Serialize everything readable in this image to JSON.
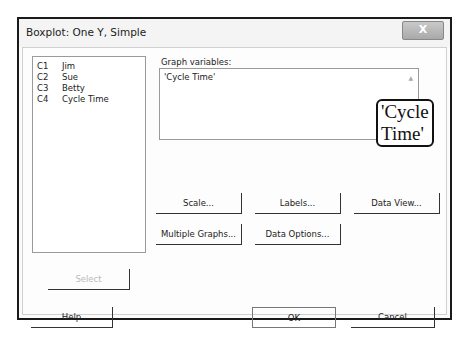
{
  "dialog": {
    "title": "Boxplot: One Y, Simple",
    "close_label": "X"
  },
  "variable_list": [
    {
      "column": "C1",
      "name": "Jim"
    },
    {
      "column": "C2",
      "name": "Sue"
    },
    {
      "column": "C3",
      "name": "Betty"
    },
    {
      "column": "C4",
      "name": "Cycle Time"
    }
  ],
  "graph_variables": {
    "label": "Graph variables:",
    "value": "'Cycle Time'",
    "callout": "'Cycle Time'"
  },
  "buttons": {
    "scale": "Scale...",
    "labels": "Labels...",
    "data_view": "Data View...",
    "multiple_graphs": "Multiple Graphs...",
    "data_options": "Data Options...",
    "select": "Select",
    "help": "Help",
    "ok": "OK",
    "cancel": "Cancel"
  },
  "icons": {
    "scroll_up": "▲",
    "scroll_down": "▼"
  }
}
